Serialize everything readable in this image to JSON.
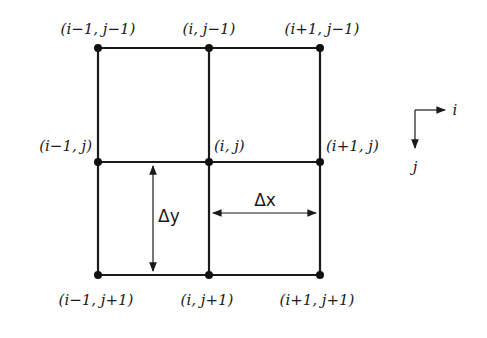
{
  "diagram": {
    "type": "finite-difference-grid",
    "grid": {
      "columns": [
        "i-1",
        "i",
        "i+1"
      ],
      "rows": [
        "j-1",
        "j",
        "j+1"
      ]
    },
    "nodes": [
      {
        "id": "n-im1-jm1",
        "label": "(i−1, j−1)"
      },
      {
        "id": "n-i-jm1",
        "label": "(i, j−1)"
      },
      {
        "id": "n-ip1-jm1",
        "label": "(i+1, j−1)"
      },
      {
        "id": "n-im1-j",
        "label": "(i−1, j)"
      },
      {
        "id": "n-i-j",
        "label": "(i, j)"
      },
      {
        "id": "n-ip1-j",
        "label": "(i+1, j)"
      },
      {
        "id": "n-im1-jp1",
        "label": "(i−1, j+1)"
      },
      {
        "id": "n-i-jp1",
        "label": "(i, j+1)"
      },
      {
        "id": "n-ip1-jp1",
        "label": "(i+1, j+1)"
      }
    ],
    "dimensions": {
      "dx": "Δx",
      "dy": "Δy"
    },
    "axes": {
      "horizontal": "i",
      "vertical": "j"
    }
  }
}
